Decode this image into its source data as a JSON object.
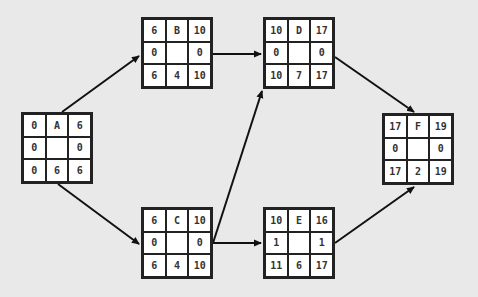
{
  "diagram": {
    "type": "activity-on-node network (critical path)",
    "background_color": "#e9e9e9",
    "border_color": "#222222",
    "nodes": {
      "A": {
        "es": "0",
        "id": "A",
        "ef": "6",
        "ls_slack": "0",
        "lf_slack": "0",
        "ls": "0",
        "dur": "6",
        "lf": "6",
        "x": 21,
        "y": 112
      },
      "B": {
        "es": "6",
        "id": "B",
        "ef": "10",
        "ls_slack": "0",
        "lf_slack": "0",
        "ls": "6",
        "dur": "4",
        "lf": "10",
        "x": 141,
        "y": 17
      },
      "C": {
        "es": "6",
        "id": "C",
        "ef": "10",
        "ls_slack": "0",
        "lf_slack": "0",
        "ls": "6",
        "dur": "4",
        "lf": "10",
        "x": 141,
        "y": 207
      },
      "D": {
        "es": "10",
        "id": "D",
        "ef": "17",
        "ls_slack": "0",
        "lf_slack": "0",
        "ls": "10",
        "dur": "7",
        "lf": "17",
        "x": 263,
        "y": 17
      },
      "E": {
        "es": "10",
        "id": "E",
        "ef": "16",
        "ls_slack": "1",
        "lf_slack": "1",
        "ls": "11",
        "dur": "6",
        "lf": "17",
        "x": 263,
        "y": 207
      },
      "F": {
        "es": "17",
        "id": "F",
        "ef": "19",
        "ls_slack": "0",
        "lf_slack": "0",
        "ls": "17",
        "dur": "2",
        "lf": "19",
        "x": 382,
        "y": 113
      }
    },
    "edges": [
      {
        "from": "A",
        "to": "B"
      },
      {
        "from": "A",
        "to": "C"
      },
      {
        "from": "B",
        "to": "D"
      },
      {
        "from": "C",
        "to": "D"
      },
      {
        "from": "C",
        "to": "E"
      },
      {
        "from": "D",
        "to": "F"
      },
      {
        "from": "E",
        "to": "F"
      }
    ]
  }
}
